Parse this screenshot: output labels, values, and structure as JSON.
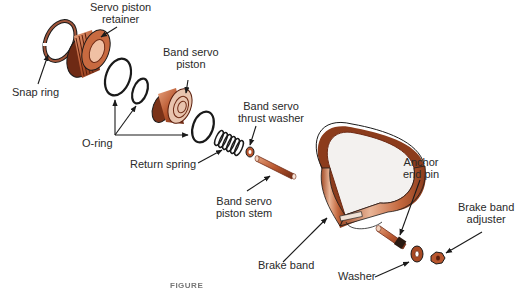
{
  "diagram": {
    "type": "exploded-view",
    "colors": {
      "copper": "#b8562e",
      "copper_light": "#e6a27e",
      "copper_dark": "#6e2a14",
      "outline": "#1a1a1a",
      "label_text": "#2a2a2a"
    },
    "labels": {
      "servo_piston_retainer": [
        "Servo piston",
        "retainer"
      ],
      "snap_ring": [
        "Snap ring"
      ],
      "band_servo_piston": [
        "Band servo",
        "piston"
      ],
      "band_servo_thrust_washer": [
        "Band servo",
        "thrust washer"
      ],
      "o_ring": [
        "O-ring"
      ],
      "return_spring": [
        "Return spring"
      ],
      "band_servo_piston_stem": [
        "Band servo",
        "piston stem"
      ],
      "brake_band": [
        "Brake band"
      ],
      "anchor_end_pin": [
        "Anchor",
        "end pin"
      ],
      "brake_band_adjuster": [
        "Brake band",
        "adjuster"
      ],
      "washer": [
        "Washer"
      ]
    },
    "caption": {
      "prefix": "FIGURE",
      "text": "(caption partially cut off / illegible)"
    }
  }
}
